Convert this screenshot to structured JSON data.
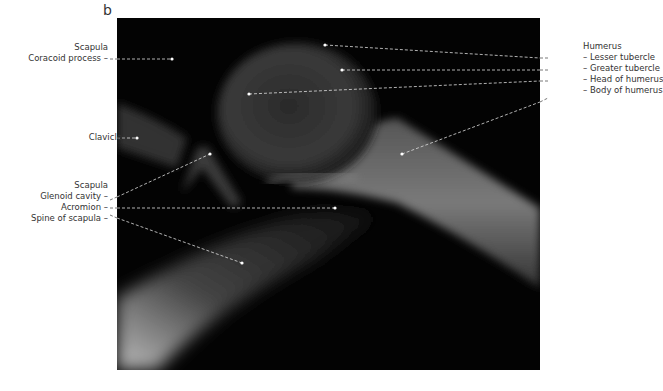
{
  "figure": {
    "panel_label": "b",
    "left_labels": {
      "scapula_group_1": {
        "heading": "Scapula",
        "items": [
          "Coracoid process –"
        ]
      },
      "clavicle": "Clavicle",
      "scapula_group_2": {
        "heading": "Scapula",
        "items": [
          "Glenoid cavity –",
          "Acromion –",
          "Spine of scapula –"
        ]
      }
    },
    "right_labels": {
      "heading": "Humerus",
      "items": [
        "– Lesser tubercle",
        "– Greater tubercle",
        "– Head of humerus",
        "– Body of humerus"
      ]
    }
  }
}
